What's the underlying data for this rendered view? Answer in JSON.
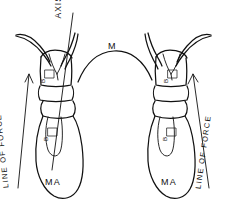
{
  "figure": {
    "title_visible": false,
    "background_color": "#ffffff",
    "ink_color": "#111111",
    "style": "hand-drawn anatomical line diagram",
    "width": 227,
    "height": 215
  },
  "labels": {
    "axis": "AXIS",
    "muscle": "M",
    "line_of_force_left": "LINE OF FORCE",
    "line_of_force_right": "LINE OF FORCE",
    "mass_left": "MA",
    "mass_right": "MA",
    "segment_upper_left": "B",
    "segment_upper_right": "B",
    "segment_lower_left": "B",
    "segment_lower_right": "B"
  },
  "annotations": [
    {
      "name": "axis-line",
      "type": "line",
      "description": "long straight axis line through left structure"
    },
    {
      "name": "line-of-force-left-arrow",
      "type": "arrow",
      "direction": "up"
    },
    {
      "name": "line-of-force-right-arrow",
      "type": "arrow",
      "direction": "up"
    },
    {
      "name": "muscle-arc",
      "type": "curve",
      "description": "arc connecting the two structures labeled M"
    }
  ]
}
